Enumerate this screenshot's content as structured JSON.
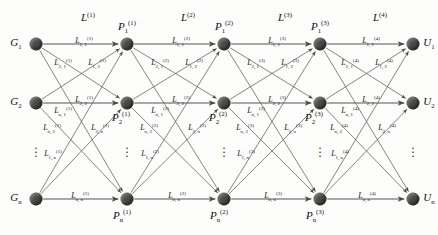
{
  "diagram": {
    "type": "layered-network-graph",
    "title": "",
    "node_color": "#4a4a4a",
    "edge_color": "#555555",
    "background": "#fdfdfc",
    "columns": 5,
    "rows_per_column": 3,
    "row_ellipsis": "⋮",
    "layer_labels": [
      {
        "id": "layer-1",
        "text": "L",
        "sup": "(1)",
        "x": 88,
        "y": 17
      },
      {
        "id": "layer-2",
        "text": "L",
        "sup": "(2)",
        "x": 188,
        "y": 17
      },
      {
        "id": "layer-3",
        "text": "L",
        "sup": "(3)",
        "x": 285,
        "y": 17
      },
      {
        "id": "layer-4",
        "text": "L",
        "sup": "(4)",
        "x": 380,
        "y": 17
      }
    ],
    "nodes": [
      {
        "id": "G1",
        "text": "G",
        "sub": "1",
        "sup": "",
        "x": 36,
        "y": 44,
        "label_x": 16,
        "label_y": 44,
        "label_pos": "left"
      },
      {
        "id": "G2",
        "text": "G",
        "sub": "2",
        "sup": "",
        "x": 36,
        "y": 103,
        "label_x": 16,
        "label_y": 103,
        "label_pos": "left"
      },
      {
        "id": "Gn",
        "text": "G",
        "sub": "n",
        "sup": "",
        "x": 36,
        "y": 199,
        "label_x": 16,
        "label_y": 199,
        "label_pos": "left"
      },
      {
        "id": "P1_1",
        "text": "P",
        "sub": "1",
        "sup": "(1)",
        "x": 127,
        "y": 44,
        "label_x": 127,
        "label_y": 27,
        "label_pos": "top"
      },
      {
        "id": "P2_1",
        "text": "P",
        "sub": "2",
        "sup": "(1)",
        "x": 127,
        "y": 103,
        "label_x": 121,
        "label_y": 118,
        "label_pos": "bottom"
      },
      {
        "id": "Pn_1",
        "text": "P",
        "sub": "n",
        "sup": "(1)",
        "x": 127,
        "y": 199,
        "label_x": 122,
        "label_y": 216,
        "label_pos": "bottom"
      },
      {
        "id": "P1_2",
        "text": "P",
        "sub": "1",
        "sup": "(2)",
        "x": 224,
        "y": 44,
        "label_x": 224,
        "label_y": 27,
        "label_pos": "top"
      },
      {
        "id": "P2_2",
        "text": "P",
        "sub": "2",
        "sup": "(2)",
        "x": 224,
        "y": 103,
        "label_x": 218,
        "label_y": 118,
        "label_pos": "bottom"
      },
      {
        "id": "Pn_2",
        "text": "P",
        "sub": "n",
        "sup": "(2)",
        "x": 224,
        "y": 199,
        "label_x": 219,
        "label_y": 216,
        "label_pos": "bottom"
      },
      {
        "id": "P1_3",
        "text": "P",
        "sub": "1",
        "sup": "(3)",
        "x": 320,
        "y": 44,
        "label_x": 320,
        "label_y": 27,
        "label_pos": "top"
      },
      {
        "id": "P2_3",
        "text": "P",
        "sub": "2",
        "sup": "(3)",
        "x": 320,
        "y": 103,
        "label_x": 314,
        "label_y": 118,
        "label_pos": "bottom"
      },
      {
        "id": "Pn_3",
        "text": "P",
        "sub": "n",
        "sup": "(3)",
        "x": 320,
        "y": 199,
        "label_x": 315,
        "label_y": 216,
        "label_pos": "bottom"
      },
      {
        "id": "U1",
        "text": "U",
        "sub": "1",
        "sup": "",
        "x": 413,
        "y": 44,
        "label_x": 429,
        "label_y": 44,
        "label_pos": "right"
      },
      {
        "id": "U2",
        "text": "U",
        "sub": "2",
        "sup": "",
        "x": 413,
        "y": 103,
        "label_x": 429,
        "label_y": 103,
        "label_pos": "right"
      },
      {
        "id": "Un",
        "text": "U",
        "sub": "n",
        "sup": "",
        "x": 413,
        "y": 199,
        "label_x": 429,
        "label_y": 199,
        "label_pos": "right"
      }
    ],
    "column_ellipses": [
      {
        "id": "ellipsis-col-g",
        "x": 36,
        "y": 152
      },
      {
        "id": "ellipsis-col-p1",
        "x": 127,
        "y": 152
      },
      {
        "id": "ellipsis-col-p2",
        "x": 224,
        "y": 152
      },
      {
        "id": "ellipsis-col-p3",
        "x": 320,
        "y": 152
      },
      {
        "id": "ellipsis-col-u",
        "x": 413,
        "y": 152
      }
    ],
    "edge_labels": [
      {
        "id": "e-l1-11",
        "text": "L",
        "sub": "1, 1",
        "sup": "(1)",
        "x": 84,
        "y": 42
      },
      {
        "id": "e-l1-21",
        "text": "L",
        "sub": "2, 1",
        "sup": "(1)",
        "x": 63,
        "y": 64
      },
      {
        "id": "e-l1-12",
        "text": "L",
        "sub": "1, 2",
        "sup": "(1)",
        "x": 97,
        "y": 64
      },
      {
        "id": "e-l1-22",
        "text": "L",
        "sub": "2, 2",
        "sup": "(1)",
        "x": 84,
        "y": 101
      },
      {
        "id": "e-l1-n1",
        "text": "L",
        "sub": "n, 1",
        "sup": "(1)",
        "x": 63,
        "y": 112
      },
      {
        "id": "e-l1-n2",
        "text": "L",
        "sub": "n, 2",
        "sup": "(1)",
        "x": 52,
        "y": 129
      },
      {
        "id": "e-l1-2n",
        "text": "L",
        "sub": "2, n",
        "sup": "(1)",
        "x": 100,
        "y": 129
      },
      {
        "id": "e-l1-1n",
        "text": "L",
        "sub": "1, n",
        "sup": "(1)",
        "x": 53,
        "y": 155
      },
      {
        "id": "e-l1-nn",
        "text": "L",
        "sub": "n, n",
        "sup": "(1)",
        "x": 80,
        "y": 197
      },
      {
        "id": "e-l2-11",
        "text": "L",
        "sub": "1, 1",
        "sup": "(2)",
        "x": 181,
        "y": 42
      },
      {
        "id": "e-l2-21",
        "text": "L",
        "sub": "2, 1",
        "sup": "(2)",
        "x": 160,
        "y": 64
      },
      {
        "id": "e-l2-12",
        "text": "L",
        "sub": "1, 2",
        "sup": "(2)",
        "x": 194,
        "y": 64
      },
      {
        "id": "e-l2-22",
        "text": "L",
        "sub": "2, 2",
        "sup": "(2)",
        "x": 181,
        "y": 101
      },
      {
        "id": "e-l2-n1",
        "text": "L",
        "sub": "n, 1",
        "sup": "(2)",
        "x": 160,
        "y": 112
      },
      {
        "id": "e-l2-n2",
        "text": "L",
        "sub": "n, 2",
        "sup": "(2)",
        "x": 149,
        "y": 129
      },
      {
        "id": "e-l2-2n",
        "text": "L",
        "sub": "2, n",
        "sup": "(2)",
        "x": 197,
        "y": 129
      },
      {
        "id": "e-l2-1n",
        "text": "L",
        "sub": "1, n",
        "sup": "(2)",
        "x": 150,
        "y": 155
      },
      {
        "id": "e-l2-nn",
        "text": "L",
        "sub": "n, n",
        "sup": "(2)",
        "x": 177,
        "y": 197
      },
      {
        "id": "e-l3-11",
        "text": "L",
        "sub": "1, 1",
        "sup": "(3)",
        "x": 277,
        "y": 42
      },
      {
        "id": "e-l3-21",
        "text": "L",
        "sub": "2, 1",
        "sup": "(3)",
        "x": 256,
        "y": 64
      },
      {
        "id": "e-l3-12",
        "text": "L",
        "sub": "1, 2",
        "sup": "(3)",
        "x": 290,
        "y": 64
      },
      {
        "id": "e-l3-22",
        "text": "L",
        "sub": "2, 2",
        "sup": "(3)",
        "x": 277,
        "y": 101
      },
      {
        "id": "e-l3-n1",
        "text": "L",
        "sub": "n, 1",
        "sup": "(3)",
        "x": 256,
        "y": 112
      },
      {
        "id": "e-l3-n2",
        "text": "L",
        "sub": "n, 2",
        "sup": "(3)",
        "x": 245,
        "y": 129
      },
      {
        "id": "e-l3-2n",
        "text": "L",
        "sub": "2, n",
        "sup": "(3)",
        "x": 293,
        "y": 129
      },
      {
        "id": "e-l3-1n",
        "text": "L",
        "sub": "1, n",
        "sup": "(3)",
        "x": 246,
        "y": 155
      },
      {
        "id": "e-l3-nn",
        "text": "L",
        "sub": "n, n",
        "sup": "(3)",
        "x": 273,
        "y": 197
      },
      {
        "id": "e-l4-11",
        "text": "L",
        "sub": "1, 1",
        "sup": "(4)",
        "x": 371,
        "y": 42
      },
      {
        "id": "e-l4-21",
        "text": "L",
        "sub": "2, 1",
        "sup": "(4)",
        "x": 350,
        "y": 64
      },
      {
        "id": "e-l4-12",
        "text": "L",
        "sub": "1, 2",
        "sup": "(4)",
        "x": 384,
        "y": 64
      },
      {
        "id": "e-l4-22",
        "text": "L",
        "sub": "2, 2",
        "sup": "(4)",
        "x": 371,
        "y": 101
      },
      {
        "id": "e-l4-n1",
        "text": "L",
        "sub": "n, 1",
        "sup": "(4)",
        "x": 350,
        "y": 112
      },
      {
        "id": "e-l4-n2",
        "text": "L",
        "sub": "n, 2",
        "sup": "(4)",
        "x": 339,
        "y": 129
      },
      {
        "id": "e-l4-2n",
        "text": "L",
        "sub": "2, n",
        "sup": "(4)",
        "x": 387,
        "y": 129
      },
      {
        "id": "e-l4-1n",
        "text": "L",
        "sub": "1, n",
        "sup": "(4)",
        "x": 340,
        "y": 155
      },
      {
        "id": "e-l4-nn",
        "text": "L",
        "sub": "n, n",
        "sup": "(4)",
        "x": 367,
        "y": 197
      }
    ]
  }
}
